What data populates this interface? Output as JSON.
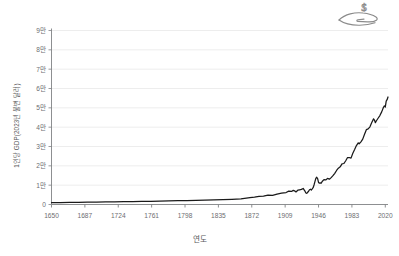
{
  "chart_data": {
    "type": "line",
    "title": "",
    "xlabel": "연도",
    "ylabel": "1인당 GDP(2023년 불변 달러)",
    "xlim": [
      1650,
      2023
    ],
    "ylim": [
      0,
      90000
    ],
    "grid": true,
    "legend": false,
    "line_color": "#1a1a1a",
    "grid_color": "#e9e9e9",
    "axis_color": "#808285",
    "xticks": [
      1650,
      1687,
      1724,
      1761,
      1798,
      1835,
      1872,
      1909,
      1946,
      1983,
      2020
    ],
    "xtick_labels": [
      "1650",
      "1687",
      "1724",
      "1761",
      "1798",
      "1835",
      "1872",
      "1909",
      "1946",
      "1983",
      "2020"
    ],
    "yticks": [
      0,
      10000,
      20000,
      30000,
      40000,
      50000,
      60000,
      70000,
      80000,
      90000
    ],
    "ytick_labels": [
      "0",
      "1만",
      "2만",
      "3만",
      "4만",
      "5만",
      "6만",
      "7만",
      "8만",
      "9만"
    ],
    "series": [
      {
        "name": "1인당 GDP",
        "x": [
          1650,
          1660,
          1670,
          1680,
          1690,
          1700,
          1710,
          1720,
          1730,
          1740,
          1750,
          1760,
          1770,
          1780,
          1790,
          1800,
          1810,
          1820,
          1830,
          1840,
          1850,
          1860,
          1870,
          1875,
          1880,
          1885,
          1890,
          1895,
          1900,
          1905,
          1910,
          1913,
          1916,
          1918,
          1920,
          1921,
          1923,
          1925,
          1927,
          1929,
          1930,
          1931,
          1932,
          1933,
          1934,
          1935,
          1936,
          1937,
          1938,
          1939,
          1940,
          1941,
          1942,
          1943,
          1944,
          1945,
          1946,
          1947,
          1948,
          1949,
          1950,
          1952,
          1954,
          1956,
          1958,
          1960,
          1962,
          1964,
          1966,
          1968,
          1970,
          1972,
          1974,
          1976,
          1978,
          1980,
          1982,
          1984,
          1986,
          1988,
          1990,
          1991,
          1993,
          1995,
          1997,
          1999,
          2001,
          2003,
          2005,
          2007,
          2008,
          2009,
          2010,
          2012,
          2014,
          2016,
          2018,
          2019,
          2020,
          2021,
          2022,
          2023
        ],
        "values": [
          950,
          1000,
          1060,
          1120,
          1180,
          1240,
          1300,
          1370,
          1440,
          1510,
          1590,
          1670,
          1760,
          1850,
          1950,
          2050,
          2160,
          2280,
          2400,
          2540,
          2700,
          2900,
          3550,
          3800,
          4150,
          4300,
          4800,
          4750,
          5400,
          5900,
          6200,
          6900,
          6750,
          7300,
          6900,
          6500,
          7400,
          7600,
          7800,
          8300,
          7600,
          6900,
          5950,
          5800,
          6350,
          6850,
          7650,
          7900,
          7500,
          8050,
          8700,
          10100,
          11800,
          13500,
          14100,
          13400,
          11400,
          11000,
          11200,
          11000,
          11900,
          12900,
          12700,
          13500,
          13100,
          13900,
          14900,
          16100,
          17600,
          18800,
          19500,
          21000,
          21200,
          22500,
          24200,
          24300,
          24000,
          26500,
          28400,
          30500,
          31900,
          31400,
          32400,
          33800,
          36300,
          38700,
          39100,
          40200,
          42400,
          44300,
          43700,
          42300,
          43200,
          44600,
          46000,
          47900,
          50300,
          51000,
          50400,
          53500,
          54200,
          55600
        ]
      }
    ],
    "annotations": []
  },
  "icons": {
    "money_hand": "hand-holding-dollar-icon",
    "dollar_glyph": "$"
  }
}
